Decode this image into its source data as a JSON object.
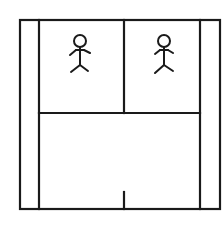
{
  "diagram": {
    "stroke_color": "#1a1a1a",
    "background": "#ffffff",
    "outer_frame": {
      "x1": 20,
      "y1": 20,
      "x2": 220,
      "y2": 209
    },
    "left_column_line_x": 39,
    "right_column_line_x": 200,
    "room_divider_x": 124,
    "horizontal_divider_y": 113,
    "bottom_tick": {
      "x": 124,
      "y1": 192,
      "y2": 209
    },
    "rooms": [
      {
        "label": "room-left",
        "figure": {
          "cx": 80,
          "head_cy": 41
        }
      },
      {
        "label": "room-right",
        "figure": {
          "cx": 164,
          "head_cy": 41
        }
      }
    ]
  }
}
